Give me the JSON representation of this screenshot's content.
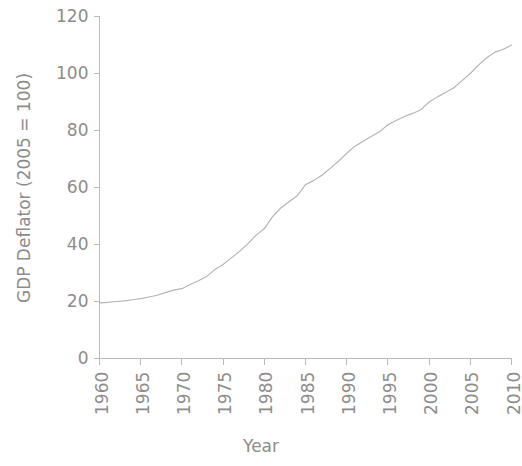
{
  "chart_data": {
    "type": "line",
    "title": "",
    "xlabel": "Year",
    "ylabel": "GDP Deflator (2005 = 100)",
    "xlim": [
      1960,
      2010
    ],
    "ylim": [
      0,
      120
    ],
    "xticks": [
      "1960",
      "1965",
      "1970",
      "1975",
      "1980",
      "1985",
      "1990",
      "1995",
      "2000",
      "2005",
      "2010"
    ],
    "yticks": [
      "0",
      "20",
      "40",
      "60",
      "80",
      "100",
      "120"
    ],
    "grid": false,
    "legend": false,
    "line_color": "#b3b3b3",
    "axis_color": "#b9b9b9",
    "text_color": "#8c8c8c",
    "x": [
      1960,
      1961,
      1962,
      1963,
      1964,
      1965,
      1966,
      1967,
      1968,
      1969,
      1970,
      1971,
      1972,
      1973,
      1974,
      1975,
      1976,
      1977,
      1978,
      1979,
      1980,
      1981,
      1982,
      1983,
      1984,
      1985,
      1986,
      1987,
      1988,
      1989,
      1990,
      1991,
      1992,
      1993,
      1994,
      1995,
      1996,
      1997,
      1998,
      1999,
      2000,
      2001,
      2002,
      2003,
      2004,
      2005,
      2006,
      2007,
      2008,
      2009,
      2010
    ],
    "values": [
      19.5,
      19.7,
      20.0,
      20.2,
      20.6,
      21.0,
      21.6,
      22.2,
      23.1,
      24.0,
      24.5,
      26.0,
      27.3,
      28.8,
      31.2,
      33.0,
      35.3,
      37.6,
      40.2,
      43.3,
      45.5,
      49.8,
      52.8,
      55.0,
      57.1,
      61.0,
      62.5,
      64.3,
      66.7,
      69.2,
      72.0,
      74.5,
      76.2,
      78.0,
      79.6,
      82.0,
      83.5,
      84.9,
      86.0,
      87.3,
      90.0,
      91.8,
      93.3,
      95.0,
      97.5,
      100.0,
      103.0,
      105.5,
      107.5,
      108.5,
      110.0
    ]
  }
}
